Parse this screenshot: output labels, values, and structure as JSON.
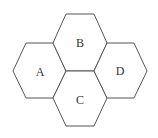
{
  "diagram": {
    "type": "hexagon-tiling",
    "stroke_color": "#555555",
    "label_color": "#333333",
    "regions": [
      {
        "id": "A",
        "label": "A",
        "center": [
          40,
          71
        ]
      },
      {
        "id": "B",
        "label": "B",
        "center": [
          80,
          43
        ]
      },
      {
        "id": "C",
        "label": "C",
        "center": [
          80,
          99
        ]
      },
      {
        "id": "D",
        "label": "D",
        "center": [
          120,
          71
        ]
      }
    ]
  }
}
